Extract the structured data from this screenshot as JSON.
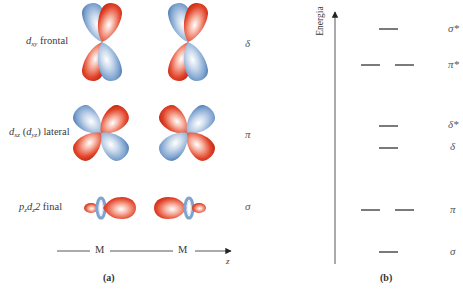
{
  "panel_a": {
    "caption": "(a)",
    "rows": [
      {
        "name": "dxy",
        "orb_main": "d",
        "orb_sub": "xy",
        "suffix": " frontal",
        "bond_type": "δ"
      },
      {
        "name": "dxz",
        "orb_main": "d",
        "orb_sub": "xz",
        "paren_main": "d",
        "paren_sub": "yz",
        "suffix": " lateral",
        "bond_type": "π"
      },
      {
        "name": "pzdz2",
        "p_main": "p",
        "p_sub": "z",
        "d_main": "d",
        "d_sub": "z",
        "d_tail": "2",
        "suffix": " final",
        "bond_type": "σ"
      }
    ],
    "axis": {
      "atom1": "M",
      "atom2": "M",
      "axis_label": "z"
    }
  },
  "panel_b": {
    "caption": "(b)",
    "axis_label": "Energia",
    "levels": [
      {
        "label": "σ*",
        "degeneracy": 1
      },
      {
        "label": "π*",
        "degeneracy": 2
      },
      {
        "label": "δ*",
        "degeneracy": 1
      },
      {
        "label": "δ",
        "degeneracy": 1
      },
      {
        "label": "π",
        "degeneracy": 2
      },
      {
        "label": "σ",
        "degeneracy": 1
      }
    ]
  },
  "colors": {
    "red_lobe": "#e2442a",
    "blue_lobe": "#7ea3cf",
    "line": "#333333"
  }
}
